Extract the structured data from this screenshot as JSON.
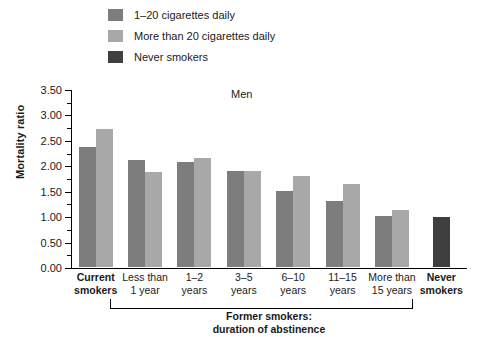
{
  "legend": {
    "items": [
      {
        "label": "1–20 cigarettes daily",
        "color": "#7d7d7d",
        "swatch_name": "legend-swatch-1-20"
      },
      {
        "label": "More than 20 cigarettes daily",
        "color": "#a8a8a8",
        "swatch_name": "legend-swatch-more-than-20"
      },
      {
        "label": "Never smokers",
        "color": "#3f3f3f",
        "swatch_name": "legend-swatch-never"
      }
    ]
  },
  "axis": {
    "y_title": "Mortality ratio",
    "y_ticks": [
      "3.50",
      "3.00",
      "2.50",
      "2.00",
      "1.50",
      "1.00",
      "0.50",
      "0.00"
    ]
  },
  "panel_title": "Men",
  "bracket_caption_line1": "Former smokers:",
  "bracket_caption_line2": "duration of abstinence",
  "x_labels": [
    {
      "line1": "Current",
      "line2": "smokers",
      "bold": true
    },
    {
      "line1": "Less than",
      "line2": "1 year",
      "bold": false
    },
    {
      "line1": "1–2",
      "line2": "years",
      "bold": false
    },
    {
      "line1": "3–5",
      "line2": "years",
      "bold": false
    },
    {
      "line1": "6–10",
      "line2": "years",
      "bold": false
    },
    {
      "line1": "11–15",
      "line2": "years",
      "bold": false
    },
    {
      "line1": "More than",
      "line2": "15 years",
      "bold": false
    },
    {
      "line1": "Never",
      "line2": "smokers",
      "bold": true
    }
  ],
  "chart_data": {
    "type": "bar",
    "title": "Men",
    "xlabel": "",
    "ylabel": "Mortality ratio",
    "ylim": [
      0,
      3.5
    ],
    "ytick_step": 0.5,
    "grid": false,
    "legend_position": "top",
    "categories": [
      "Current smokers",
      "Less than 1 year",
      "1–2 years",
      "3–5 years",
      "6–10 years",
      "11–15 years",
      "More than 15 years",
      "Never smokers"
    ],
    "series": [
      {
        "name": "1–20 cigarettes daily",
        "color": "#7d7d7d",
        "values": [
          2.35,
          2.1,
          2.06,
          1.88,
          1.49,
          1.3,
          1.0,
          null
        ]
      },
      {
        "name": "More than 20 cigarettes daily",
        "color": "#a8a8a8",
        "values": [
          2.72,
          1.87,
          2.14,
          1.88,
          1.78,
          1.63,
          1.12,
          null
        ]
      },
      {
        "name": "Never smokers",
        "color": "#3f3f3f",
        "values": [
          null,
          null,
          null,
          null,
          null,
          null,
          null,
          0.98
        ]
      }
    ],
    "annotation_bracket": {
      "text": "Former smokers: duration of abstinence",
      "spans_categories": [
        "Less than 1 year",
        "More than 15 years"
      ]
    }
  }
}
